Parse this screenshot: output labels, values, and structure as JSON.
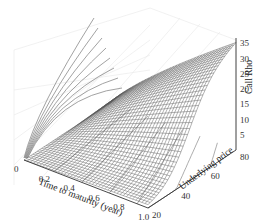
{
  "chart_data": {
    "type": "surface3d",
    "title": "",
    "xlabel": "Time to maturity (year)",
    "ylabel": "Underlying price",
    "zlabel": "Call Rho",
    "x_ticks": [
      "0",
      "0.2",
      "0.4",
      "0.6",
      "0.8",
      "1.0"
    ],
    "y_ticks": [
      "20",
      "40",
      "60",
      "80"
    ],
    "z_ticks": [
      "5",
      "10",
      "15",
      "20",
      "25",
      "30",
      "35"
    ],
    "xlim": [
      0,
      1.0
    ],
    "ylim": [
      20,
      80
    ],
    "zlim": [
      0,
      37
    ],
    "grid": true,
    "surface": {
      "x": [
        0,
        0.2,
        0.4,
        0.6,
        0.8,
        1.0
      ],
      "y": [
        20,
        40,
        60,
        80
      ],
      "z_at_y80": [
        0,
        9,
        17,
        24,
        30,
        36
      ],
      "z_at_y60": [
        0,
        6,
        12,
        17,
        22,
        26
      ],
      "z_at_y40": [
        0,
        2,
        5,
        8,
        11,
        14
      ],
      "z_at_y20": [
        0,
        0,
        0.2,
        0.5,
        1,
        1.5
      ],
      "mesh_color": "#555555"
    },
    "projections": {
      "wall_contours": 8,
      "floor_contours": 6,
      "color": "#888888"
    }
  }
}
